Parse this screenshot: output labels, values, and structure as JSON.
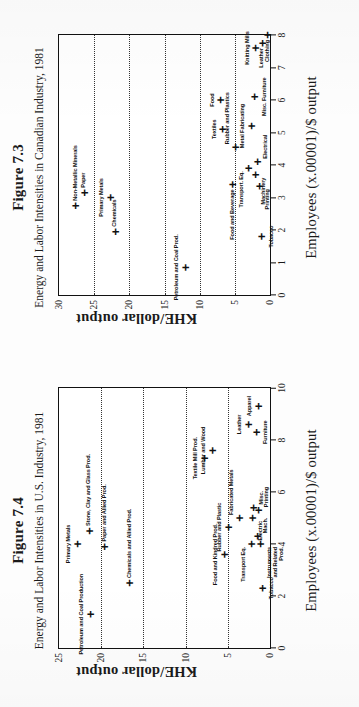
{
  "page": {
    "figures": [
      {
        "id": "figure-7-3",
        "title": "Figure 7.3",
        "subtitle": "Energy and Labor Intensities in Canadian Industry, 1981",
        "chart_data": {
          "type": "scatter",
          "title": "Energy and Labor Intensities in Canadian Industry, 1981",
          "xlabel": "Employees (x.00001)/$ output",
          "ylabel": "KHE/dollar output",
          "xlim": [
            0,
            8
          ],
          "ylim": [
            0,
            30
          ],
          "xticks": [
            0,
            1,
            2,
            3,
            4,
            5,
            6,
            7,
            8
          ],
          "yticks": [
            0,
            5,
            10,
            15,
            20,
            25,
            30
          ],
          "grid": "horizontal-dotted",
          "gridlines": [
            5,
            10,
            15,
            20,
            25
          ],
          "points": [
            {
              "label": "Non-Metallic Minerals",
              "x": 2.75,
              "y": 27.6,
              "anchor": "lab-r"
            },
            {
              "label": "Paper",
              "x": 3.15,
              "y": 26.4,
              "anchor": "lab-r"
            },
            {
              "label": "Primary Metals",
              "x": 3.0,
              "y": 22.7,
              "anchor": "lab-t"
            },
            {
              "label": "Chemicals",
              "x": 1.95,
              "y": 22.0,
              "anchor": "lab-r"
            },
            {
              "label": "Petroleum and Coal Prod.",
              "x": 0.85,
              "y": 12.0,
              "anchor": "lab-t"
            },
            {
              "label": "Textiles",
              "x": 5.1,
              "y": 6.7,
              "anchor": "lab-t"
            },
            {
              "label": "Food",
              "x": 6.0,
              "y": 7.0,
              "anchor": "lab-t"
            },
            {
              "label": "Food and Beverage",
              "x": 3.4,
              "y": 5.3,
              "anchor": "lab-l"
            },
            {
              "label": "Rubber and Plastics",
              "x": 4.55,
              "y": 4.9,
              "anchor": "lab-tr"
            },
            {
              "label": "Metal Fabricating",
              "x": 5.2,
              "y": 2.7,
              "anchor": "lab-t"
            },
            {
              "label": "Misc. Furniture",
              "x": 6.1,
              "y": 2.2,
              "anchor": "lab-b"
            },
            {
              "label": "Transport. Eq.",
              "x": 3.9,
              "y": 3.0,
              "anchor": "lab-tl"
            },
            {
              "label": "Machinery",
              "x": 3.7,
              "y": 2.1,
              "anchor": "lab-bl"
            },
            {
              "label": "Electrical",
              "x": 4.1,
              "y": 1.8,
              "anchor": "lab-br"
            },
            {
              "label": "Printing",
              "x": 3.35,
              "y": 1.5,
              "anchor": "lab-bl"
            },
            {
              "label": "Tobacco",
              "x": 1.8,
              "y": 1.2,
              "anchor": "lab-b"
            },
            {
              "label": "Knitting Mills",
              "x": 7.6,
              "y": 2.0,
              "anchor": "lab-t"
            },
            {
              "label": "Leather",
              "x": 7.75,
              "y": 1.1,
              "anchor": "lab-l"
            },
            {
              "label": "Clothing",
              "x": 8.0,
              "y": 0.35,
              "anchor": "lab-l"
            }
          ]
        }
      },
      {
        "id": "figure-7-4",
        "title": "Figure 7.4",
        "subtitle": "Energy and Labor Intensities in U.S. Industry, 1981",
        "chart_data": {
          "type": "scatter",
          "title": "Energy and Labor Intensities in U.S. Industry, 1981",
          "xlabel": "Employees (x.00001)/$ output",
          "ylabel": "KHE/dollar output",
          "xlim": [
            0,
            10
          ],
          "ylim": [
            0,
            25
          ],
          "xticks": [
            0,
            2,
            4,
            6,
            8,
            10
          ],
          "yticks": [
            0,
            5,
            10,
            15,
            20,
            25
          ],
          "grid": "horizontal-dotted",
          "gridlines": [
            5,
            10,
            15,
            20
          ],
          "points": [
            {
              "label": "Primary Metals",
              "x": 4.0,
              "y": 22.8,
              "anchor": "lab-t"
            },
            {
              "label": "Stone, Clay and Glass Prod.",
              "x": 4.5,
              "y": 21.4,
              "anchor": "lab-r"
            },
            {
              "label": "Petroleum and Coal Production",
              "x": 1.3,
              "y": 21.3,
              "anchor": "lab-t"
            },
            {
              "label": "Paper and Allied Prod.",
              "x": 3.9,
              "y": 19.6,
              "anchor": "lab-r"
            },
            {
              "label": "Chemicals and Allied Prod.",
              "x": 2.5,
              "y": 16.6,
              "anchor": "lab-r"
            },
            {
              "label": "Textile Mill Prod.",
              "x": 7.3,
              "y": 7.8,
              "anchor": "lab-t"
            },
            {
              "label": "Lumber and Wood",
              "x": 7.6,
              "y": 6.8,
              "anchor": "lab-t"
            },
            {
              "label": "Food and Kindred Prod.",
              "x": 3.6,
              "y": 5.4,
              "anchor": "lab-t"
            },
            {
              "label": "Rubber and Plastic",
              "x": 4.65,
              "y": 4.9,
              "anchor": "lab-t"
            },
            {
              "label": "Fabricated Metals",
              "x": 5.0,
              "y": 3.6,
              "anchor": "lab-tr"
            },
            {
              "label": "Leather",
              "x": 8.6,
              "y": 2.6,
              "anchor": "lab-t"
            },
            {
              "label": "Furniture",
              "x": 8.3,
              "y": 1.6,
              "anchor": "lab-b"
            },
            {
              "label": "Apparel",
              "x": 9.3,
              "y": 1.4,
              "anchor": "lab-t"
            },
            {
              "label": "Electric",
              "x": 5.0,
              "y": 2.1,
              "anchor": "lab-bl"
            },
            {
              "label": "Misc.",
              "x": 5.4,
              "y": 2.0,
              "anchor": "lab-br"
            },
            {
              "label": "Printing",
              "x": 5.3,
              "y": 1.4,
              "anchor": "lab-br"
            },
            {
              "label": "Mach.",
              "x": 4.3,
              "y": 1.5,
              "anchor": "lab-br"
            },
            {
              "label": "Transport Eq.",
              "x": 4.0,
              "y": 2.2,
              "anchor": "lab-tl"
            },
            {
              "label": "Instruments\nand Related\nProd.",
              "x": 4.0,
              "y": 1.1,
              "anchor": "lab-bl"
            },
            {
              "label": "Tobacco",
              "x": 2.3,
              "y": 0.9,
              "anchor": "lab-b"
            }
          ]
        }
      }
    ]
  }
}
